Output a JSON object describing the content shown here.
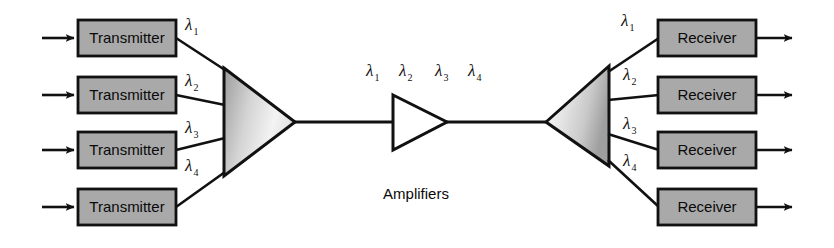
{
  "figure": {
    "caption": "Amplifiers",
    "colors": {
      "box_fill": "#a9a9a9",
      "line": "#111111",
      "amp_fill": "#ffffff",
      "background": "#ffffff",
      "mux_fill_light": "#f2f2f2",
      "mux_fill_dark": "#9a9a9a"
    }
  },
  "transmitters": [
    {
      "label": "Transmitter",
      "wavelength": "λ",
      "channel": "1"
    },
    {
      "label": "Transmitter",
      "wavelength": "λ",
      "channel": "2"
    },
    {
      "label": "Transmitter",
      "wavelength": "λ",
      "channel": "3"
    },
    {
      "label": "Transmitter",
      "wavelength": "λ",
      "channel": "4"
    }
  ],
  "receivers": [
    {
      "label": "Receiver",
      "wavelength": "λ",
      "channel": "1"
    },
    {
      "label": "Receiver",
      "wavelength": "λ",
      "channel": "2"
    },
    {
      "label": "Receiver",
      "wavelength": "λ",
      "channel": "3"
    },
    {
      "label": "Receiver",
      "wavelength": "λ",
      "channel": "4"
    }
  ],
  "trunk_wavelengths": [
    {
      "wavelength": "λ",
      "channel": "1"
    },
    {
      "wavelength": "λ",
      "channel": "2"
    },
    {
      "wavelength": "λ",
      "channel": "3"
    },
    {
      "wavelength": "λ",
      "channel": "4"
    }
  ],
  "multiplexer": {
    "name": "multiplexer",
    "orientation": "apex-right"
  },
  "demultiplexer": {
    "name": "demultiplexer",
    "orientation": "apex-left"
  },
  "amplifier": {
    "name": "amplifier",
    "orientation": "apex-right"
  }
}
